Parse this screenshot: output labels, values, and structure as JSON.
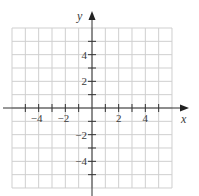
{
  "chart_data": {
    "type": "scatter",
    "title": "",
    "xlabel": "x",
    "ylabel": "y",
    "xlim": [
      -6,
      6
    ],
    "ylim": [
      -6,
      6
    ],
    "grid": true,
    "grid_step": 1,
    "x_ticks": [
      -5,
      -4,
      -3,
      -2,
      -1,
      1,
      2,
      3,
      4,
      5
    ],
    "y_ticks": [
      -5,
      -4,
      -3,
      -2,
      -1,
      1,
      2,
      3,
      4,
      5
    ],
    "x_tick_labels": [
      {
        "value": -4,
        "label": "−4"
      },
      {
        "value": -2,
        "label": "−2"
      },
      {
        "value": 2,
        "label": "2"
      },
      {
        "value": 4,
        "label": "4"
      }
    ],
    "y_tick_labels": [
      {
        "value": 4,
        "label": "4"
      },
      {
        "value": 2,
        "label": "2"
      },
      {
        "value": -2,
        "label": "−2"
      },
      {
        "value": -4,
        "label": "−4"
      }
    ],
    "series": [],
    "colors": {
      "grid": "#cfcfcf",
      "axis": "#333333",
      "text": "#3a3a3a"
    }
  }
}
